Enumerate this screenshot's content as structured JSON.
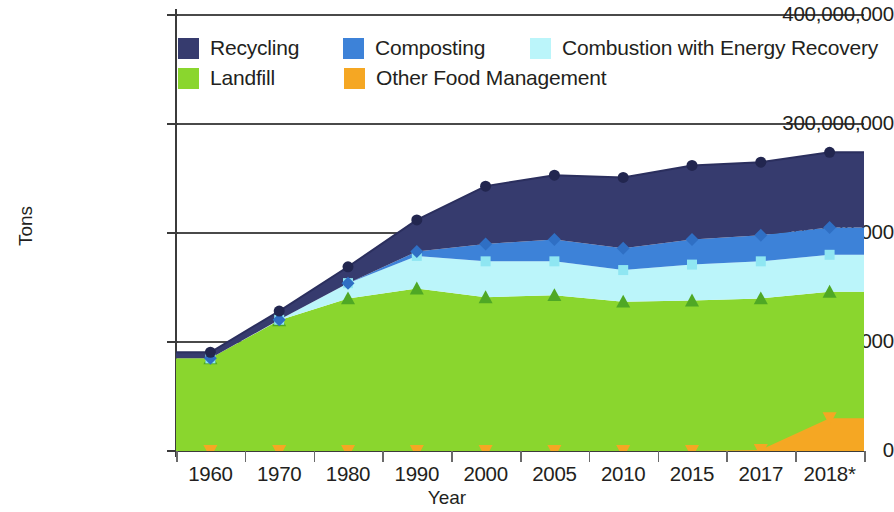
{
  "chart_data": {
    "type": "area",
    "title": "",
    "xlabel": "Year",
    "ylabel": "Tons",
    "stacked": true,
    "grid": true,
    "legend_position": "top-inside",
    "ylim": [
      0,
      400000000
    ],
    "yticks": [
      0,
      100000000,
      200000000,
      300000000,
      400000000
    ],
    "ytick_labels": [
      "0",
      "100,000,000",
      "200,000,000",
      "300,000,000",
      "400,000,000"
    ],
    "categories": [
      "1960",
      "1970",
      "1980",
      "1990",
      "2000",
      "2005",
      "2010",
      "2015",
      "2017",
      "2018*"
    ],
    "series": [
      {
        "name": "Landfill",
        "color": "#8ad62e",
        "marker": "triangle",
        "values": [
          85000000,
          120000000,
          140000000,
          149000000,
          141000000,
          143000000,
          137000000,
          138000000,
          140000000,
          146000000
        ]
      },
      {
        "name": "Combustion with Energy Recovery",
        "color": "#bbf5fa",
        "marker": "square",
        "values": [
          0,
          400000,
          14000000,
          30000000,
          33000000,
          31000000,
          29000000,
          33000000,
          34000000,
          34000000
        ]
      },
      {
        "name": "Composting",
        "color": "#3d82d8",
        "marker": "diamond",
        "values": [
          0,
          0,
          0,
          4000000,
          16000000,
          20000000,
          20000000,
          23000000,
          24000000,
          25000000
        ]
      },
      {
        "name": "Recycling",
        "color": "#363b6e",
        "marker": "circle",
        "values": [
          5600000,
          8000000,
          15000000,
          29000000,
          53000000,
          59000000,
          65000000,
          68000000,
          67000000,
          69000000
        ]
      },
      {
        "name": "Other Food Management",
        "color": "#f5a723",
        "marker": "triangle-down",
        "values": [
          0,
          0,
          0,
          0,
          0,
          0,
          0,
          0,
          1000000,
          30000000
        ]
      }
    ],
    "cumulative_totals": [
      90600000,
      128400000,
      169000000,
      212000000,
      243000000,
      253000000,
      251000000,
      262000000,
      266000000,
      304000000
    ]
  },
  "legend": {
    "rows": [
      [
        {
          "label": "Recycling",
          "color": "#363b6e"
        },
        {
          "label": "Composting",
          "color": "#3d82d8"
        },
        {
          "label": "Combustion with Energy Recovery",
          "color": "#bbf5fa"
        }
      ],
      [
        {
          "label": "Landfill",
          "color": "#8ad62e"
        },
        {
          "label": "Other Food Management",
          "color": "#f5a723"
        }
      ]
    ]
  },
  "axes": {
    "y_title": "Tons",
    "x_title": "Year"
  }
}
